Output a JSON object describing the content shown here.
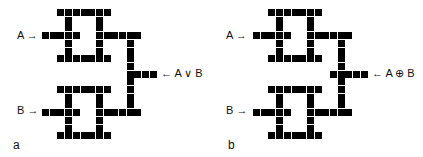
{
  "panels": [
    {
      "id": "a",
      "panel_label": "a",
      "input_a_label": "A →",
      "input_b_label": "B →",
      "output_label": "← A ∨ B",
      "origin": [
        42,
        9
      ],
      "label_pos": {
        "a": [
          17,
          29
        ],
        "b": [
          17,
          104
        ],
        "out": [
          161,
          67
        ],
        "panel": [
          13,
          138
        ]
      },
      "cells": [
        [
          2,
          0
        ],
        [
          3,
          0
        ],
        [
          4,
          0
        ],
        [
          5,
          0
        ],
        [
          6,
          0
        ],
        [
          7,
          0
        ],
        [
          8,
          0
        ],
        [
          3,
          1
        ],
        [
          7,
          1
        ],
        [
          3,
          2
        ],
        [
          7,
          2
        ],
        [
          0,
          3
        ],
        [
          1,
          3
        ],
        [
          2,
          3
        ],
        [
          3,
          3
        ],
        [
          4,
          3
        ],
        [
          7,
          3
        ],
        [
          8,
          3
        ],
        [
          9,
          3
        ],
        [
          10,
          3
        ],
        [
          11,
          3
        ],
        [
          12,
          3
        ],
        [
          3,
          4
        ],
        [
          7,
          4
        ],
        [
          11,
          4
        ],
        [
          3,
          5
        ],
        [
          7,
          5
        ],
        [
          11,
          5
        ],
        [
          2,
          6
        ],
        [
          3,
          6
        ],
        [
          4,
          6
        ],
        [
          5,
          6
        ],
        [
          6,
          6
        ],
        [
          7,
          6
        ],
        [
          8,
          6
        ],
        [
          11,
          6
        ],
        [
          11,
          7
        ],
        [
          11,
          8
        ],
        [
          12,
          8
        ],
        [
          13,
          8
        ],
        [
          14,
          8
        ],
        [
          11,
          9
        ],
        [
          2,
          10
        ],
        [
          3,
          10
        ],
        [
          4,
          10
        ],
        [
          5,
          10
        ],
        [
          6,
          10
        ],
        [
          7,
          10
        ],
        [
          8,
          10
        ],
        [
          11,
          10
        ],
        [
          3,
          11
        ],
        [
          7,
          11
        ],
        [
          11,
          11
        ],
        [
          3,
          12
        ],
        [
          7,
          12
        ],
        [
          11,
          12
        ],
        [
          0,
          13
        ],
        [
          1,
          13
        ],
        [
          2,
          13
        ],
        [
          3,
          13
        ],
        [
          4,
          13
        ],
        [
          7,
          13
        ],
        [
          8,
          13
        ],
        [
          9,
          13
        ],
        [
          10,
          13
        ],
        [
          11,
          13
        ],
        [
          12,
          13
        ],
        [
          3,
          14
        ],
        [
          7,
          14
        ],
        [
          3,
          15
        ],
        [
          7,
          15
        ],
        [
          2,
          16
        ],
        [
          3,
          16
        ],
        [
          4,
          16
        ],
        [
          5,
          16
        ],
        [
          6,
          16
        ],
        [
          7,
          16
        ],
        [
          8,
          16
        ]
      ]
    },
    {
      "id": "b",
      "panel_label": "b",
      "input_a_label": "A →",
      "input_b_label": "B →",
      "output_label": "← A ⊕ B",
      "origin": [
        253,
        9
      ],
      "label_pos": {
        "a": [
          226,
          29
        ],
        "b": [
          226,
          104
        ],
        "out": [
          372,
          67
        ],
        "panel": [
          228,
          138
        ]
      },
      "cells": [
        [
          2,
          0
        ],
        [
          3,
          0
        ],
        [
          4,
          0
        ],
        [
          5,
          0
        ],
        [
          6,
          0
        ],
        [
          7,
          0
        ],
        [
          8,
          0
        ],
        [
          3,
          1
        ],
        [
          7,
          1
        ],
        [
          3,
          2
        ],
        [
          7,
          2
        ],
        [
          0,
          3
        ],
        [
          1,
          3
        ],
        [
          2,
          3
        ],
        [
          3,
          3
        ],
        [
          4,
          3
        ],
        [
          7,
          3
        ],
        [
          8,
          3
        ],
        [
          9,
          3
        ],
        [
          10,
          3
        ],
        [
          11,
          3
        ],
        [
          12,
          3
        ],
        [
          3,
          4
        ],
        [
          7,
          4
        ],
        [
          11,
          4
        ],
        [
          3,
          5
        ],
        [
          7,
          5
        ],
        [
          11,
          5
        ],
        [
          2,
          6
        ],
        [
          3,
          6
        ],
        [
          4,
          6
        ],
        [
          5,
          6
        ],
        [
          6,
          6
        ],
        [
          7,
          6
        ],
        [
          8,
          6
        ],
        [
          11,
          6
        ],
        [
          11,
          7
        ],
        [
          10,
          8
        ],
        [
          11,
          8
        ],
        [
          12,
          8
        ],
        [
          13,
          8
        ],
        [
          14,
          8
        ],
        [
          11,
          9
        ],
        [
          2,
          10
        ],
        [
          3,
          10
        ],
        [
          4,
          10
        ],
        [
          5,
          10
        ],
        [
          6,
          10
        ],
        [
          7,
          10
        ],
        [
          8,
          10
        ],
        [
          11,
          10
        ],
        [
          3,
          11
        ],
        [
          7,
          11
        ],
        [
          11,
          11
        ],
        [
          3,
          12
        ],
        [
          7,
          12
        ],
        [
          11,
          12
        ],
        [
          0,
          13
        ],
        [
          1,
          13
        ],
        [
          2,
          13
        ],
        [
          3,
          13
        ],
        [
          4,
          13
        ],
        [
          7,
          13
        ],
        [
          8,
          13
        ],
        [
          9,
          13
        ],
        [
          10,
          13
        ],
        [
          11,
          13
        ],
        [
          12,
          13
        ],
        [
          3,
          14
        ],
        [
          7,
          14
        ],
        [
          3,
          15
        ],
        [
          7,
          15
        ],
        [
          2,
          16
        ],
        [
          3,
          16
        ],
        [
          4,
          16
        ],
        [
          5,
          16
        ],
        [
          6,
          16
        ],
        [
          7,
          16
        ],
        [
          8,
          16
        ]
      ]
    }
  ],
  "grid": {
    "pitch": 7.7,
    "cell_size": 7,
    "color": "#000000"
  }
}
